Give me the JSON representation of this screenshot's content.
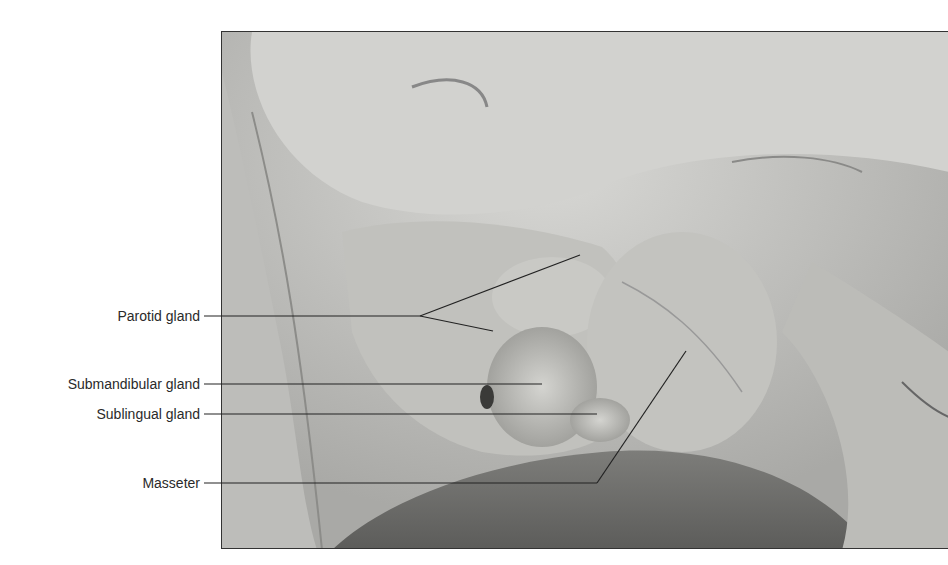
{
  "figure": {
    "labels": [
      {
        "text": "Parotid gland",
        "x_right": 200,
        "y": 316
      },
      {
        "text": "Submandibular gland",
        "x_right": 200,
        "y": 384
      },
      {
        "text": "Sublingual gland",
        "x_right": 200,
        "y": 414
      },
      {
        "text": "Masseter",
        "x_right": 200,
        "y": 483
      }
    ],
    "leader_color": "#222222"
  }
}
